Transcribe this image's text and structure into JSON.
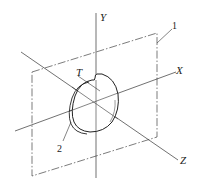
{
  "diagram": {
    "type": "isometric-coordinate-sketch",
    "axes": {
      "x_label": "X",
      "y_label": "Y",
      "z_label": "Z"
    },
    "labels": {
      "plane_callout": "1",
      "disc_callout": "2",
      "notch_label": "T"
    },
    "colors": {
      "line": "#333333",
      "background": "#ffffff"
    }
  }
}
